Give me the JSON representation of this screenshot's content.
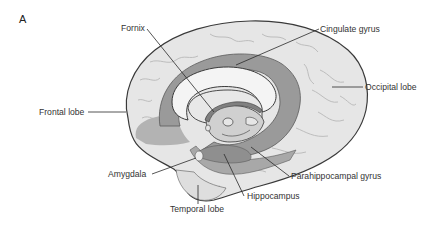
{
  "figure": {
    "panel_letter": "A"
  },
  "colors": {
    "background": "#ffffff",
    "cortex_light": "#e6e6e6",
    "cortex_sulcus": "#bdbdbd",
    "limbic_dark": "#9a9a9a",
    "limbic_mid": "#b3b3b3",
    "corpus_callosum": "#f4f4f4",
    "inner_structure": "#d0d0d0",
    "fornix": "#808080",
    "outline": "#3a3a3a",
    "leader_line": "#2a2a2a",
    "label_text": "#333333"
  },
  "labels": [
    {
      "id": "fornix",
      "text": "Fornix"
    },
    {
      "id": "cingulate-gyrus",
      "text": "Cingulate gyrus"
    },
    {
      "id": "occipital-lobe",
      "text": "Occipital lobe"
    },
    {
      "id": "frontal-lobe",
      "text": "Frontal lobe"
    },
    {
      "id": "amygdala",
      "text": "Amygdala"
    },
    {
      "id": "parahippocampal-gyrus",
      "text": "Parahippocampal gyrus"
    },
    {
      "id": "hippocampus",
      "text": "Hippocampus"
    },
    {
      "id": "temporal-lobe",
      "text": "Temporal lobe"
    }
  ]
}
